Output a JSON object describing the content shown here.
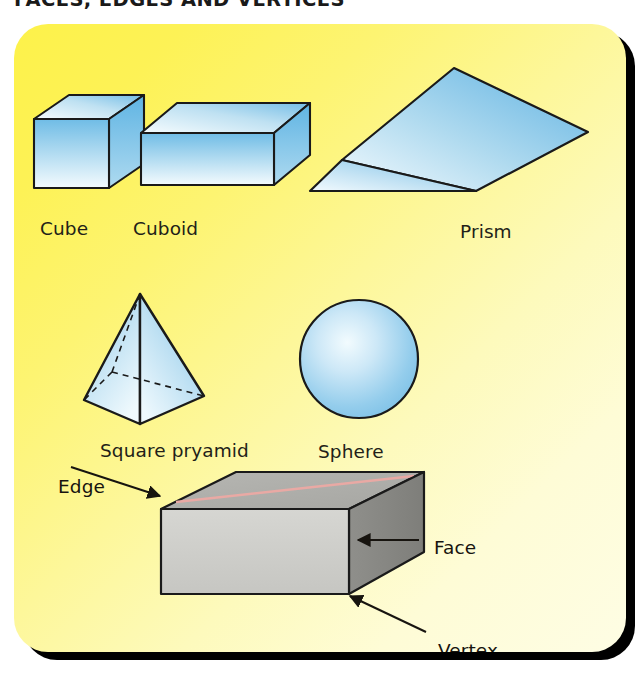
{
  "figure": {
    "title": "FACES, EDGES AND VERTICES",
    "panel_background_top_left": "#FDF24A",
    "panel_background_bottom_right": "#FEFDE4",
    "panel_shadow_color": "#000000",
    "shape_fill_light": "#FFFFFF",
    "shape_fill_blue": "#5CAEE0",
    "shape_outline": "#1A1A1A",
    "grey_box_front": "#CFCFCB",
    "grey_box_top": "#AFAFAB",
    "grey_box_side": "#8A8A86",
    "grey_box_streak": "#E9A9A4"
  },
  "shapes": [
    {
      "id": "cube",
      "label": "Cube",
      "kind": "cube"
    },
    {
      "id": "cuboid",
      "label": "Cuboid",
      "kind": "cuboid"
    },
    {
      "id": "prism",
      "label": "Prism",
      "kind": "triangular-prism"
    },
    {
      "id": "square-pyramid",
      "label": "Square pryamid",
      "kind": "square-pyramid"
    },
    {
      "id": "sphere",
      "label": "Sphere",
      "kind": "sphere"
    }
  ],
  "annotated_solid": {
    "kind": "cuboid",
    "callouts": [
      {
        "id": "edge",
        "label": "Edge",
        "points_to": "top-back-edge"
      },
      {
        "id": "face",
        "label": "Face",
        "points_to": "right-face"
      },
      {
        "id": "vertex",
        "label": "Vertex",
        "points_to": "bottom-front-right-corner"
      }
    ]
  }
}
